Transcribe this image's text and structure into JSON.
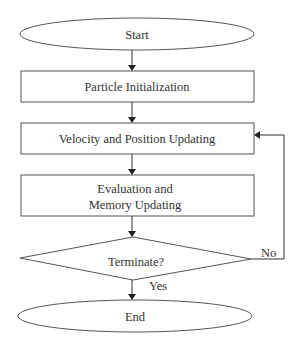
{
  "flowchart": {
    "start": {
      "label": "Start"
    },
    "init": {
      "label": "Particle Initialization"
    },
    "update": {
      "label": "Velocity and Position Updating"
    },
    "evaluate": {
      "label_line1": "Evaluation and",
      "label_line2": "Memory Updating"
    },
    "decision": {
      "label": "Terminate?"
    },
    "end": {
      "label": "End"
    },
    "edges": {
      "yes_label": "Yes",
      "no_label": "No"
    }
  }
}
